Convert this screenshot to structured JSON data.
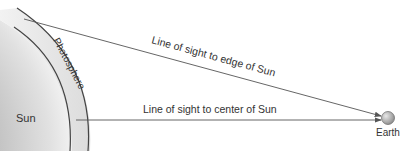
{
  "diagram": {
    "labels": {
      "sun": "Sun",
      "photosphere": "Photosphere",
      "edge_line": "Line of sight to edge of Sun",
      "center_line": "Line of sight to center of Sun",
      "earth": "Earth"
    },
    "colors": {
      "line": "#555555",
      "text": "#333333",
      "earth_fill": "#b5b5b5"
    }
  }
}
